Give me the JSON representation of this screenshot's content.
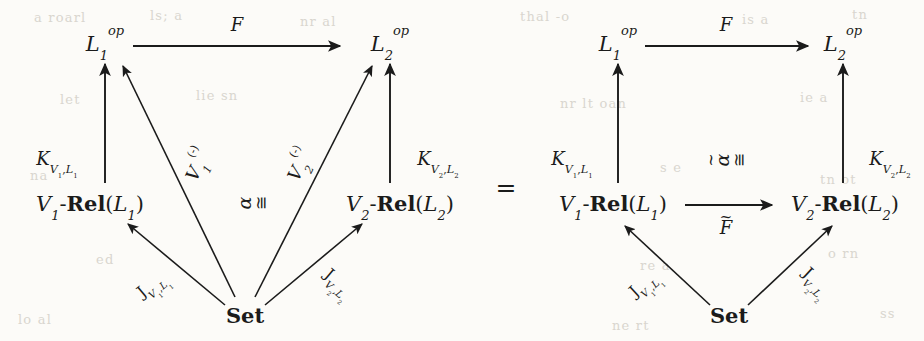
{
  "figure": {
    "kind": "commutative-diagram",
    "equals_sign": "=",
    "background_color": "#fcfbf8",
    "ink_color": "#1b1b1b"
  },
  "left_diagram": {
    "name": "left-commutative-diagram",
    "nodes": {
      "top_left": {
        "base": "L",
        "sub": "1",
        "sup": "op"
      },
      "top_right": {
        "base": "L",
        "sub": "2",
        "sup": "op"
      },
      "mid_left": {
        "v": "V",
        "v_sub": "1",
        "sep": "-",
        "rel": "Rel",
        "open": "(",
        "l": "L",
        "l_sub": "1",
        "close": ")"
      },
      "mid_right": {
        "v": "V",
        "v_sub": "2",
        "sep": "-",
        "rel": "Rel",
        "open": "(",
        "l": "L",
        "l_sub": "2",
        "close": ")"
      },
      "bottom": {
        "label": "Set"
      }
    },
    "arrows": {
      "top": {
        "label": "F"
      },
      "left_vertical": {
        "base": "K",
        "sub": "V",
        "sub_n": "1",
        "comma": ",",
        "sub_l": "L",
        "sub_ln": "1"
      },
      "right_vertical": {
        "base": "K",
        "sub": "V",
        "sub_n": "2",
        "comma": ",",
        "sub_l": "L",
        "sub_ln": "2"
      },
      "diag_v1": {
        "base": "V",
        "sub": "1",
        "sup": "(-)"
      },
      "diag_v2": {
        "base": "V",
        "sub": "2",
        "sup": "(-)"
      },
      "diag_j1": {
        "base": "J",
        "sub": "V",
        "sub_n": "1",
        "comma": ",",
        "sub_l": "L",
        "sub_ln": "1"
      },
      "diag_j2": {
        "base": "J",
        "sub": "V",
        "sub_n": "2",
        "comma": ",",
        "sub_l": "L",
        "sub_ln": "2"
      }
    },
    "cell": {
      "alpha": "α",
      "congruent": "≅",
      "has_tilde": false
    }
  },
  "right_diagram": {
    "name": "right-commutative-diagram",
    "nodes": {
      "top_left": {
        "base": "L",
        "sub": "1",
        "sup": "op"
      },
      "top_right": {
        "base": "L",
        "sub": "2",
        "sup": "op"
      },
      "mid_left": {
        "v": "V",
        "v_sub": "1",
        "sep": "-",
        "rel": "Rel",
        "open": "(",
        "l": "L",
        "l_sub": "1",
        "close": ")"
      },
      "mid_right": {
        "v": "V",
        "v_sub": "2",
        "sep": "-",
        "rel": "Rel",
        "open": "(",
        "l": "L",
        "l_sub": "2",
        "close": ")"
      },
      "bottom": {
        "label": "Set"
      }
    },
    "arrows": {
      "top": {
        "label": "F"
      },
      "middle": {
        "base": "F",
        "tilde": "~"
      },
      "left_vertical": {
        "base": "K",
        "sub": "V",
        "sub_n": "1",
        "comma": ",",
        "sub_l": "L",
        "sub_ln": "1"
      },
      "right_vertical": {
        "base": "K",
        "sub": "V",
        "sub_n": "2",
        "comma": ",",
        "sub_l": "L",
        "sub_ln": "2"
      },
      "diag_j1": {
        "base": "J",
        "sub": "V",
        "sub_n": "1",
        "comma": ",",
        "sub_l": "L",
        "sub_ln": "1"
      },
      "diag_j2": {
        "base": "J",
        "sub": "V",
        "sub_n": "2",
        "comma": ",",
        "sub_l": "L",
        "sub_ln": "2"
      }
    },
    "cell": {
      "alpha": "α",
      "tilde": "~",
      "congruent": "≅",
      "has_tilde": true
    }
  },
  "bleed_through": [
    {
      "text": "a roarl",
      "x": 34,
      "y": 10
    },
    {
      "text": "ls;  a",
      "x": 150,
      "y": 8
    },
    {
      "text": "nr  al",
      "x": 300,
      "y": 14
    },
    {
      "text": "thal  -o",
      "x": 520,
      "y": 9
    },
    {
      "text": "is a",
      "x": 742,
      "y": 12
    },
    {
      "text": "tn",
      "x": 852,
      "y": 7
    },
    {
      "text": "let",
      "x": 60,
      "y": 92
    },
    {
      "text": "lie  sn",
      "x": 196,
      "y": 88
    },
    {
      "text": "nr  lt  oan",
      "x": 560,
      "y": 96
    },
    {
      "text": "ie  a",
      "x": 800,
      "y": 90
    },
    {
      "text": "na",
      "x": 30,
      "y": 168
    },
    {
      "text": "s e",
      "x": 660,
      "y": 160
    },
    {
      "text": "tn  ot",
      "x": 820,
      "y": 172
    },
    {
      "text": "ed",
      "x": 96,
      "y": 252
    },
    {
      "text": "re  a",
      "x": 640,
      "y": 258
    },
    {
      "text": "o  rn",
      "x": 828,
      "y": 246
    },
    {
      "text": "lo  al",
      "x": 18,
      "y": 312
    },
    {
      "text": "ne  rt",
      "x": 612,
      "y": 318
    },
    {
      "text": "ss",
      "x": 880,
      "y": 306
    }
  ]
}
